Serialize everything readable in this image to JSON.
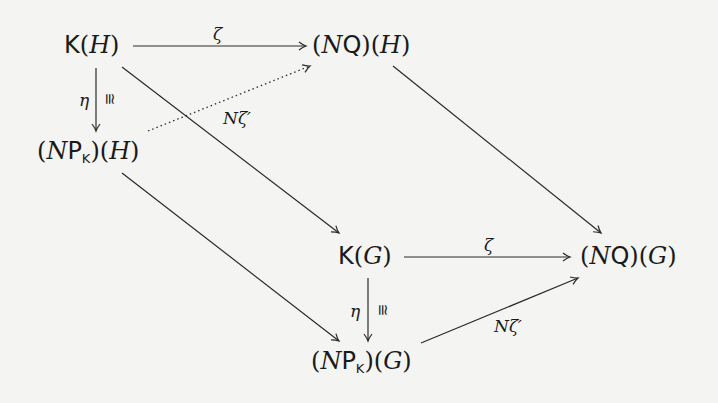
{
  "diagram": {
    "type": "commutative-diagram",
    "nodes": {
      "KH": {
        "functor": "K",
        "arg": "H"
      },
      "NQH": {
        "prefix": "(",
        "N": "N",
        "functor": "Q",
        "suffix": ")",
        "arg": "H"
      },
      "NPKH": {
        "prefix": "(",
        "N": "N",
        "functor": "P",
        "sub": "K",
        "suffix": ")",
        "arg": "H"
      },
      "KG": {
        "functor": "K",
        "arg": "G"
      },
      "NQG": {
        "prefix": "(",
        "N": "N",
        "functor": "Q",
        "suffix": ")",
        "arg": "G"
      },
      "NPKG": {
        "prefix": "(",
        "N": "N",
        "functor": "P",
        "sub": "K",
        "suffix": ")",
        "arg": "G"
      }
    },
    "labels": {
      "zeta_top": "ζ",
      "zeta_bottom": "ζ",
      "eta_left": "η",
      "eta_right": "η",
      "iso_left": "≅",
      "iso_right": "≅",
      "nzeta_dotted": "Nζ′",
      "nzeta_bottom": "Nζ′"
    },
    "edges": [
      {
        "from": "K(H)",
        "to": "(NQ)(H)",
        "label": "ζ",
        "style": "solid"
      },
      {
        "from": "K(H)",
        "to": "(NP_K)(H)",
        "label": "η ≅",
        "style": "solid"
      },
      {
        "from": "(NP_K)(H)",
        "to": "(NQ)(H)",
        "label": "Nζ′",
        "style": "dotted"
      },
      {
        "from": "K(H)",
        "to": "K(G)",
        "label": "",
        "style": "solid"
      },
      {
        "from": "(NQ)(H)",
        "to": "(NQ)(G)",
        "label": "",
        "style": "solid"
      },
      {
        "from": "(NP_K)(H)",
        "to": "(NP_K)(G)",
        "label": "",
        "style": "solid"
      },
      {
        "from": "K(G)",
        "to": "(NQ)(G)",
        "label": "ζ",
        "style": "solid"
      },
      {
        "from": "K(G)",
        "to": "(NP_K)(G)",
        "label": "η ≅",
        "style": "solid"
      },
      {
        "from": "(NP_K)(G)",
        "to": "(NQ)(G)",
        "label": "Nζ′",
        "style": "solid"
      }
    ]
  }
}
